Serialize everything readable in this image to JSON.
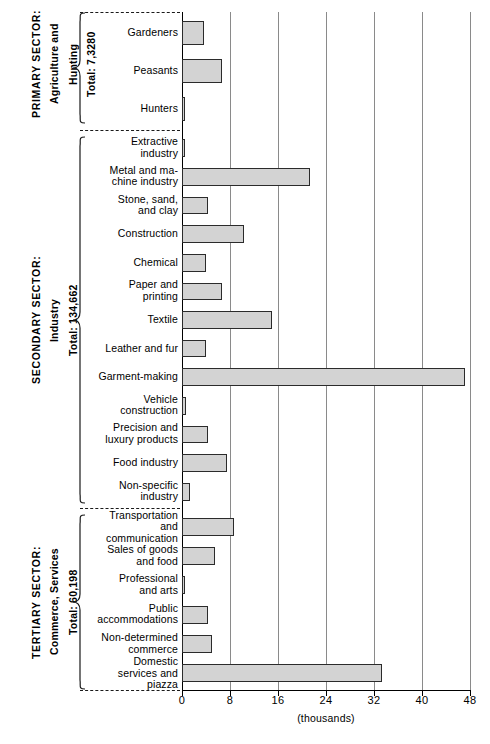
{
  "chart_data": {
    "type": "bar",
    "orientation": "horizontal",
    "title": "",
    "xlabel": "(thousands)",
    "ylabel": "",
    "xlim": [
      0,
      48
    ],
    "xticks": [
      0,
      8,
      16,
      24,
      32,
      40,
      48
    ],
    "xticklabels": [
      "0",
      "8",
      "16",
      "24",
      "32",
      "40",
      "48"
    ],
    "grid": true,
    "grid_axis": "x",
    "legend": false,
    "bar_fill_color": "#d3d3d3",
    "bar_edge_color": "#2b2b2b",
    "categories": [
      "Gardeners",
      "Peasants",
      "Hunters",
      "Extractive industry",
      "Metal and machine industry",
      "Stone, sand, and clay",
      "Construction",
      "Chemical",
      "Paper and printing",
      "Textile",
      "Leather and fur",
      "Garment-making",
      "Vehicle construction",
      "Precision and luxury products",
      "Food industry",
      "Non-specific industry",
      "Transportation and communication",
      "Sales of goods and food",
      "Professional and arts",
      "Public accommodations",
      "Non-determined commerce",
      "Domestic services and piazza"
    ],
    "values": [
      3.6,
      6.6,
      0.4,
      0.4,
      21.4,
      4.4,
      10.4,
      4.0,
      6.6,
      15.0,
      4.0,
      47.2,
      0.7,
      4.4,
      7.5,
      1.4,
      8.6,
      5.5,
      0.5,
      4.4,
      5.0,
      33.4
    ]
  },
  "sectors": [
    {
      "id": "primary",
      "name": "PRIMARY SECTOR:",
      "sub": "Agriculture and\nHunting",
      "total": "Total: 7,3280",
      "items": [
        {
          "label": "Gardeners",
          "value": 3.6
        },
        {
          "label": "Peasants",
          "value": 6.6
        },
        {
          "label": "Hunters",
          "value": 0.4
        }
      ]
    },
    {
      "id": "secondary",
      "name": "SECONDARY SECTOR:",
      "sub": "Industry",
      "total": "Total: 134,662",
      "items": [
        {
          "label": "Extractive\nindustry",
          "value": 0.4
        },
        {
          "label": "Metal and ma-\nchine industry",
          "value": 21.4
        },
        {
          "label": "Stone, sand,\nand clay",
          "value": 4.4
        },
        {
          "label": "Construction",
          "value": 10.4
        },
        {
          "label": "Chemical",
          "value": 4.0
        },
        {
          "label": "Paper and\nprinting",
          "value": 6.6
        },
        {
          "label": "Textile",
          "value": 15.0
        },
        {
          "label": "Leather and fur",
          "value": 4.0
        },
        {
          "label": "Garment-making",
          "value": 47.2
        },
        {
          "label": "Vehicle\nconstruction",
          "value": 0.7
        },
        {
          "label": "Precision and\nluxury products",
          "value": 4.4
        },
        {
          "label": "Food industry",
          "value": 7.5
        },
        {
          "label": "Non-specific\nindustry",
          "value": 1.4
        }
      ]
    },
    {
      "id": "tertiary",
      "name": "TERTIARY SECTOR:",
      "sub": "Commerce, Services",
      "total": "Total: 60,198",
      "items": [
        {
          "label": "Transportation\nand\ncommunication",
          "value": 8.6
        },
        {
          "label": "Sales of goods\nand food",
          "value": 5.5
        },
        {
          "label": "Professional\nand arts",
          "value": 0.5
        },
        {
          "label": "Public\naccommodations",
          "value": 4.4
        },
        {
          "label": "Non-determined\ncommerce",
          "value": 5.0
        },
        {
          "label": "Domestic\nservices and\npiazza",
          "value": 33.4
        }
      ]
    }
  ],
  "axis": {
    "unit_label": "(thousands)"
  }
}
